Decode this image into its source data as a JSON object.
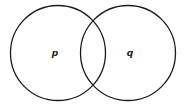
{
  "diagram": {
    "type": "venn",
    "sets": [
      {
        "label": "p",
        "cx": 58,
        "cy": 53,
        "r": 48
      },
      {
        "label": "q",
        "cx": 128,
        "cy": 53,
        "r": 48
      }
    ],
    "stroke_color": "#1a1a1a",
    "background": "#ffffff"
  }
}
